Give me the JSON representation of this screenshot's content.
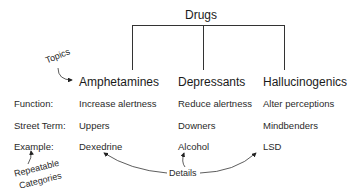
{
  "root": "Drugs",
  "topics": [
    "Amphetamines",
    "Depressants",
    "Hallucinogenics"
  ],
  "rows": [
    {
      "label": "Function:",
      "values": [
        "Increase alertness",
        "Reduce alertness",
        "Alter perceptions"
      ]
    },
    {
      "label": "Street Term:",
      "values": [
        "Uppers",
        "Downers",
        "Mindbenders"
      ]
    },
    {
      "label": "Example:",
      "values": [
        "Dexedrine",
        "Alcohol",
        "LSD"
      ]
    }
  ],
  "annotations": {
    "topics": "Topics",
    "categories_line1": "Repeatable",
    "categories_line2": "Categories",
    "details": "Details"
  }
}
